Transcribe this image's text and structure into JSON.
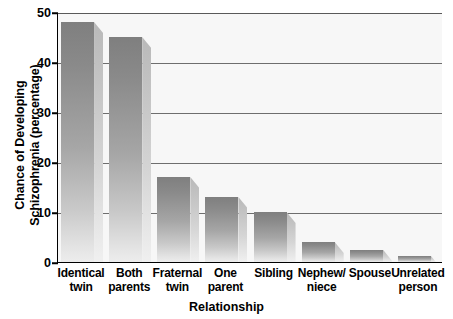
{
  "chart_data": {
    "type": "bar",
    "title": "",
    "xlabel": "Relationship",
    "ylabel": "Chance of Developing Schizophrenia (percentage)",
    "ylabel_lines": [
      "Chance of Developing",
      "Schizophrenia (percentage)"
    ],
    "categories": [
      "Identical twin",
      "Both parents",
      "Fraternal twin",
      "One parent",
      "Sibling",
      "Nephew/ niece",
      "Spouse",
      "Unrelated person"
    ],
    "category_lines": [
      [
        "Identical",
        "twin"
      ],
      [
        "Both",
        "parents"
      ],
      [
        "Fraternal",
        "twin"
      ],
      [
        "One",
        "parent"
      ],
      [
        "Sibling",
        ""
      ],
      [
        "Nephew/",
        "niece"
      ],
      [
        "Spouse",
        ""
      ],
      [
        "Unrelated",
        "person"
      ]
    ],
    "values": [
      48,
      45,
      17,
      13,
      10,
      4,
      2.5,
      1.2
    ],
    "ylim": [
      0,
      50
    ],
    "yticks": [
      0,
      10,
      20,
      30,
      40,
      50
    ],
    "ytick_labels": [
      "0",
      "10",
      "20",
      "30",
      "40",
      "50"
    ],
    "grid": true,
    "legend": false,
    "bar_color": "#8f8f8f",
    "plot_background": "#f7f7f7",
    "axis_color": "#000000"
  }
}
